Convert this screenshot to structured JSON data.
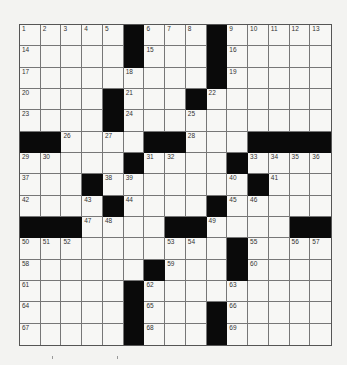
{
  "puzzle": {
    "rows": 15,
    "cols": 15,
    "black_cells": [
      [
        0,
        5
      ],
      [
        0,
        9
      ],
      [
        1,
        5
      ],
      [
        1,
        9
      ],
      [
        2,
        9
      ],
      [
        3,
        4
      ],
      [
        3,
        8
      ],
      [
        4,
        4
      ],
      [
        5,
        0
      ],
      [
        5,
        1
      ],
      [
        5,
        6
      ],
      [
        5,
        7
      ],
      [
        5,
        11
      ],
      [
        5,
        12
      ],
      [
        5,
        13
      ],
      [
        5,
        14
      ],
      [
        6,
        5
      ],
      [
        6,
        10
      ],
      [
        7,
        3
      ],
      [
        7,
        11
      ],
      [
        8,
        4
      ],
      [
        8,
        9
      ],
      [
        9,
        0
      ],
      [
        9,
        1
      ],
      [
        9,
        2
      ],
      [
        9,
        7
      ],
      [
        9,
        8
      ],
      [
        9,
        13
      ],
      [
        9,
        14
      ],
      [
        10,
        10
      ],
      [
        11,
        6
      ],
      [
        11,
        10
      ],
      [
        12,
        5
      ],
      [
        13,
        5
      ],
      [
        13,
        9
      ],
      [
        14,
        5
      ],
      [
        14,
        9
      ]
    ],
    "numbers": [
      {
        "n": "1",
        "r": 0,
        "c": 0
      },
      {
        "n": "2",
        "r": 0,
        "c": 1
      },
      {
        "n": "3",
        "r": 0,
        "c": 2
      },
      {
        "n": "4",
        "r": 0,
        "c": 3
      },
      {
        "n": "5",
        "r": 0,
        "c": 4
      },
      {
        "n": "6",
        "r": 0,
        "c": 6
      },
      {
        "n": "7",
        "r": 0,
        "c": 7
      },
      {
        "n": "8",
        "r": 0,
        "c": 8
      },
      {
        "n": "9",
        "r": 0,
        "c": 10
      },
      {
        "n": "10",
        "r": 0,
        "c": 11
      },
      {
        "n": "11",
        "r": 0,
        "c": 12
      },
      {
        "n": "12",
        "r": 0,
        "c": 13
      },
      {
        "n": "13",
        "r": 0,
        "c": 14
      },
      {
        "n": "14",
        "r": 1,
        "c": 0
      },
      {
        "n": "15",
        "r": 1,
        "c": 6
      },
      {
        "n": "16",
        "r": 1,
        "c": 10
      },
      {
        "n": "17",
        "r": 2,
        "c": 0
      },
      {
        "n": "18",
        "r": 2,
        "c": 5
      },
      {
        "n": "19",
        "r": 2,
        "c": 10
      },
      {
        "n": "20",
        "r": 3,
        "c": 0
      },
      {
        "n": "21",
        "r": 3,
        "c": 5
      },
      {
        "n": "22",
        "r": 3,
        "c": 9
      },
      {
        "n": "23",
        "r": 4,
        "c": 0
      },
      {
        "n": "24",
        "r": 4,
        "c": 5
      },
      {
        "n": "25",
        "r": 4,
        "c": 8
      },
      {
        "n": "26",
        "r": 5,
        "c": 2
      },
      {
        "n": "27",
        "r": 5,
        "c": 4
      },
      {
        "n": "28",
        "r": 5,
        "c": 8
      },
      {
        "n": "29",
        "r": 6,
        "c": 0
      },
      {
        "n": "30",
        "r": 6,
        "c": 1
      },
      {
        "n": "31",
        "r": 6,
        "c": 6
      },
      {
        "n": "32",
        "r": 6,
        "c": 7
      },
      {
        "n": "33",
        "r": 6,
        "c": 11
      },
      {
        "n": "34",
        "r": 6,
        "c": 12
      },
      {
        "n": "35",
        "r": 6,
        "c": 13
      },
      {
        "n": "36",
        "r": 6,
        "c": 14
      },
      {
        "n": "37",
        "r": 7,
        "c": 0
      },
      {
        "n": "38",
        "r": 7,
        "c": 4
      },
      {
        "n": "39",
        "r": 7,
        "c": 5
      },
      {
        "n": "40",
        "r": 7,
        "c": 10
      },
      {
        "n": "41",
        "r": 7,
        "c": 12
      },
      {
        "n": "42",
        "r": 8,
        "c": 0
      },
      {
        "n": "43",
        "r": 8,
        "c": 3
      },
      {
        "n": "44",
        "r": 8,
        "c": 5
      },
      {
        "n": "45",
        "r": 8,
        "c": 10
      },
      {
        "n": "46",
        "r": 8,
        "c": 11
      },
      {
        "n": "47",
        "r": 9,
        "c": 3
      },
      {
        "n": "48",
        "r": 9,
        "c": 4
      },
      {
        "n": "49",
        "r": 9,
        "c": 9
      },
      {
        "n": "50",
        "r": 10,
        "c": 0
      },
      {
        "n": "51",
        "r": 10,
        "c": 1
      },
      {
        "n": "52",
        "r": 10,
        "c": 2
      },
      {
        "n": "53",
        "r": 10,
        "c": 7
      },
      {
        "n": "54",
        "r": 10,
        "c": 8
      },
      {
        "n": "55",
        "r": 10,
        "c": 11
      },
      {
        "n": "56",
        "r": 10,
        "c": 13
      },
      {
        "n": "57",
        "r": 10,
        "c": 14
      },
      {
        "n": "58",
        "r": 11,
        "c": 0
      },
      {
        "n": "59",
        "r": 11,
        "c": 7
      },
      {
        "n": "60",
        "r": 11,
        "c": 11
      },
      {
        "n": "61",
        "r": 12,
        "c": 0
      },
      {
        "n": "62",
        "r": 12,
        "c": 6
      },
      {
        "n": "63",
        "r": 12,
        "c": 10
      },
      {
        "n": "64",
        "r": 13,
        "c": 0
      },
      {
        "n": "65",
        "r": 13,
        "c": 6
      },
      {
        "n": "66",
        "r": 13,
        "c": 10
      },
      {
        "n": "67",
        "r": 14,
        "c": 0
      },
      {
        "n": "68",
        "r": 14,
        "c": 6
      },
      {
        "n": "69",
        "r": 14,
        "c": 10
      }
    ]
  },
  "colors": {
    "black_square": "#0a0a0a",
    "white_square": "#f7f7f5",
    "grid_line": "#777777",
    "paper": "#f3f3f1"
  }
}
